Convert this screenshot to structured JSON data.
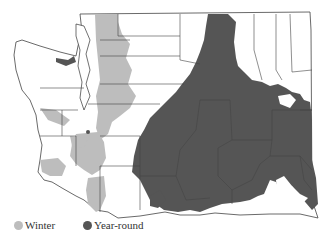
{
  "map": {
    "region": "Washington State counties",
    "colors": {
      "winter": "#bdbdbd",
      "year_round": "#555555",
      "county_lines": "#444444",
      "land": "#ffffff"
    }
  },
  "legend": {
    "items": [
      {
        "label": "Winter",
        "color": "#bdbdbd"
      },
      {
        "label": "Year-round",
        "color": "#555555"
      }
    ]
  }
}
